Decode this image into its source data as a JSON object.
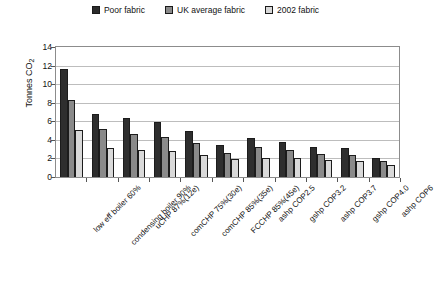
{
  "chart_data": {
    "type": "bar",
    "title": "",
    "xlabel": "",
    "ylabel": "Tonnes CO",
    "ylabel_sub": "2",
    "ylim": [
      0,
      14
    ],
    "yticks": [
      0,
      2,
      4,
      6,
      8,
      10,
      12,
      14
    ],
    "grid": true,
    "legend_position": "top-center",
    "categories": [
      "low eff boiler 60%",
      "condensing boiler 90%",
      "uCHP 87%(12e)",
      "comCHP 75%(30e)",
      "comCHP 85%(35e)",
      "FCCHP 85%(45e)",
      "ashp COP2.5",
      "gshp COP3.2",
      "ashp COP3.7",
      "gshp COP4.0",
      "ashp COP6"
    ],
    "series": [
      {
        "name": "Poor fabric",
        "color": "#2e2e2e",
        "values": [
          11.6,
          6.8,
          6.4,
          5.9,
          5.0,
          3.4,
          4.2,
          3.8,
          3.2,
          3.1,
          2.1
        ]
      },
      {
        "name": "UK average fabric",
        "color": "#8a8a8a",
        "values": [
          8.3,
          5.2,
          4.6,
          4.3,
          3.7,
          2.6,
          3.2,
          2.9,
          2.5,
          2.4,
          1.7
        ]
      },
      {
        "name": "2002 fabric",
        "color": "#d9d9d9",
        "values": [
          5.1,
          3.1,
          2.9,
          2.8,
          2.4,
          1.9,
          2.1,
          2.0,
          1.8,
          1.7,
          1.3
        ]
      }
    ]
  },
  "legend": {
    "items": [
      {
        "label": "Poor fabric"
      },
      {
        "label": "UK average fabric"
      },
      {
        "label": "2002 fabric"
      }
    ]
  }
}
